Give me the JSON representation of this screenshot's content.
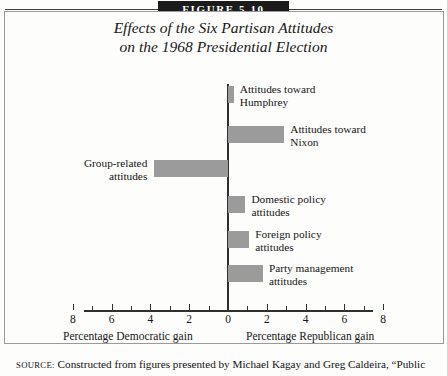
{
  "figure": {
    "number_label": "FIGURE 5.10",
    "title_line1": "Effects of the Six Partisan Attitudes",
    "title_line2": "on the 1968 Presidential Election",
    "source_label": "SOURCE:",
    "source_text": "Constructed from figures presented by Michael Kagay and Greg Caldeira, “Public"
  },
  "axis": {
    "left_caption": "Percentage Democratic gain",
    "right_caption": "Percentage Republican gain",
    "tick_labels": [
      "8",
      "6",
      "4",
      "2",
      "0",
      "2",
      "4",
      "6",
      "8"
    ],
    "tick_values": [
      -8,
      -6,
      -4,
      -2,
      0,
      2,
      4,
      6,
      8
    ],
    "minor_tick_values": [
      -7,
      -5,
      -3,
      -1,
      1,
      3,
      5,
      7
    ],
    "min": -8.6,
    "max": 8.6
  },
  "chart_data": {
    "type": "bar",
    "orientation": "horizontal",
    "title": "Effects of the Six Partisan Attitudes on the 1968 Presidential Election",
    "xlabel": "Percentage Democratic gain / Percentage Republican gain",
    "ylabel": "",
    "xlim": [
      -8.6,
      8.6
    ],
    "grid": false,
    "legend": "none",
    "bar_color": "#9b9b9b",
    "note": "Positive values extend right (Republican gain); negative values extend left (Democratic gain).",
    "categories": [
      "Attitudes toward Humphrey",
      "Attitudes toward Nixon",
      "Group-related attitudes",
      "Domestic policy attitudes",
      "Foreign policy attitudes",
      "Party management attitudes"
    ],
    "values": [
      0.3,
      2.9,
      -3.8,
      0.9,
      1.1,
      1.8
    ]
  },
  "bars": [
    {
      "name": "attitudes-toward-humphrey",
      "label_line1": "Attitudes toward",
      "label_line2": "Humphrey",
      "value": 0.3,
      "direction": "right"
    },
    {
      "name": "attitudes-toward-nixon",
      "label_line1": "Attitudes toward",
      "label_line2": "Nixon",
      "value": 2.9,
      "direction": "right"
    },
    {
      "name": "group-related-attitudes",
      "label_line1": "Group-related",
      "label_line2": "attitudes",
      "value": -3.8,
      "direction": "left"
    },
    {
      "name": "domestic-policy-attitudes",
      "label_line1": "Domestic policy",
      "label_line2": "attitudes",
      "value": 0.9,
      "direction": "right"
    },
    {
      "name": "foreign-policy-attitudes",
      "label_line1": "Foreign policy",
      "label_line2": "attitudes",
      "value": 1.1,
      "direction": "right"
    },
    {
      "name": "party-management-attitudes",
      "label_line1": "Party management",
      "label_line2": "attitudes",
      "value": 1.8,
      "direction": "right"
    }
  ]
}
